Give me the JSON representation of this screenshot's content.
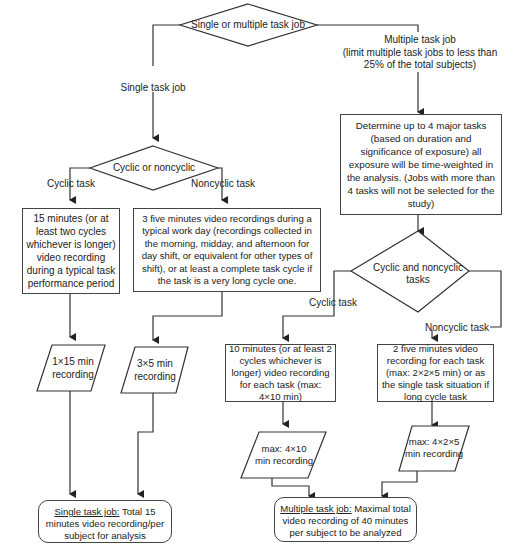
{
  "flowchart": {
    "decision_job_type": "Single or multiple task job",
    "branch_single": "Single task job",
    "branch_multiple": {
      "line1": "Multiple task job",
      "line2": "(limit multiple task jobs to less than",
      "line3": "25% of the total subjects)"
    },
    "single": {
      "decision": "Cyclic or noncyclic",
      "branch_cyclic": "Cyclic task",
      "branch_noncyclic": "Noncyclic task",
      "cyclic_process": "15 minutes (or at least two cycles whichever is longer) video recording during a typical task performance period",
      "noncyclic_process": "3 five minutes video recordings during a typical work day (recordings collected in the morning, midday, and afternoon for day shift, or equivalent for other types of shift), or at least a complete task cycle if the task is a very long cycle one.",
      "cyclic_data": "1×15 min recording",
      "noncyclic_data": "3×5 min recording",
      "terminal_title": "Single task job:",
      "terminal_text": "Total 15 minutes video recording/per subject for analysis"
    },
    "multiple": {
      "process_determine": "Determine up to 4 major tasks (based on duration and significance of exposure) all exposure will be time-weighted in the analysis. (Jobs with more than 4 tasks will not be selected for the study)",
      "decision": "Cyclic and noncyclic tasks",
      "branch_cyclic": "Cyclic task",
      "branch_noncyclic": "Noncyclic task",
      "cyclic_process": "10 minutes (or at least 2 cycles whichever is longer) video recording for each task (max: 4×10 min)",
      "noncyclic_process": "2 five minutes video recording for each task (max: 2×2×5 min) or as the single task situation if long cycle task",
      "cyclic_data": "max: 4×10 min recording",
      "noncyclic_data": "max: 4×2×5 min recording",
      "terminal_title": "Multiple task job:",
      "terminal_text": "Maximal total video recording of 40 minutes per subject to be analyzed"
    }
  }
}
